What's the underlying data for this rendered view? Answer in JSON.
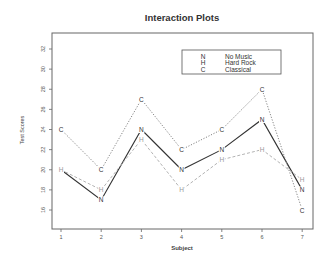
{
  "chart_data": {
    "type": "line",
    "title": "Interaction Plots",
    "xlabel": "Subject",
    "ylabel": "Test Scores",
    "x": [
      1,
      2,
      3,
      4,
      5,
      6,
      7
    ],
    "xticks": [
      "1",
      "2",
      "3",
      "4",
      "5",
      "6",
      "7"
    ],
    "yticks": [
      16,
      18,
      20,
      22,
      24,
      26,
      28,
      30,
      32
    ],
    "ylim": [
      14.2,
      33.5
    ],
    "grid": false,
    "legend_position": "top-right",
    "series": [
      {
        "name": "No Music",
        "symbol": "N",
        "values": [
          20,
          17,
          24,
          20,
          22,
          25,
          18
        ],
        "color": "#333333",
        "style": "solid"
      },
      {
        "name": "Hard Rock",
        "symbol": "H",
        "values": [
          20,
          18,
          23,
          18,
          21,
          22,
          19
        ],
        "color": "#aaaaaa",
        "style": "dashed"
      },
      {
        "name": "Classical",
        "symbol": "C",
        "values": [
          24,
          20,
          27,
          22,
          24,
          28,
          16
        ],
        "color": "#777777",
        "style": "dotted"
      }
    ]
  }
}
